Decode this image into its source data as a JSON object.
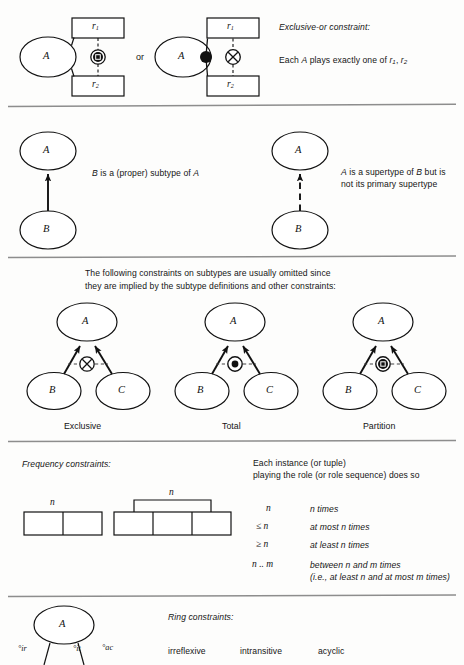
{
  "page": {
    "background": "#fdfdfc",
    "ink": "#1a1a1a",
    "rule_color": "#8a8a8a"
  },
  "section_xor": {
    "diagram_left": {
      "entity_label": "A",
      "role_box_1": "r",
      "role_box_1_sub": "1",
      "role_box_2": "r",
      "role_box_2_sub": "2",
      "constraint_symbol": "circled-dot-square"
    },
    "connector_word": "or",
    "diagram_right": {
      "entity_label": "A",
      "role_box_1": "r",
      "role_box_1_sub": "1",
      "role_box_2": "r",
      "role_box_2_sub": "2",
      "dot_symbol": "filled-dot",
      "constraint_symbol": "circled-x"
    },
    "heading": "Exclusive-or constraint:",
    "description_prefix": "Each ",
    "description_var": "A",
    "description_mid": " plays exactly one of ",
    "description_r1": "r",
    "description_r1_sub": "1",
    "description_comma": ", ",
    "description_r2": "r",
    "description_r2_sub": "2"
  },
  "section_subtype": {
    "left": {
      "super_label": "A",
      "sub_label": "B",
      "arrow_style": "solid",
      "text_prefix": "B",
      "text_body": " is a (proper) subtype of ",
      "text_suffix": "A"
    },
    "right": {
      "super_label": "A",
      "sub_label": "B",
      "arrow_style": "dashed",
      "text_line1_a": "A",
      "text_line1_b": " is a supertype of ",
      "text_line1_c": "B",
      "text_line1_d": " but is",
      "text_line2": "not its primary supertype"
    }
  },
  "section_implied": {
    "note_line1": "The following constraints on subtypes are usually omitted since",
    "note_line2": "they are implied by the subtype definitions and other constraints:",
    "diagrams": [
      {
        "super_label": "A",
        "sub_left_label": "B",
        "sub_right_label": "C",
        "symbol": "circled-x",
        "caption": "Exclusive"
      },
      {
        "super_label": "A",
        "sub_left_label": "B",
        "sub_right_label": "C",
        "symbol": "circled-dot",
        "caption": "Total"
      },
      {
        "super_label": "A",
        "sub_left_label": "B",
        "sub_right_label": "C",
        "symbol": "circled-dot-square",
        "caption": "Partition"
      }
    ]
  },
  "section_frequency": {
    "heading": "Frequency constraints:",
    "diagram_left_label": "n",
    "diagram_right_label": "n",
    "right_note_line1": "Each instance (or tuple)",
    "right_note_line2": "playing the role (or role sequence) does so",
    "rows": [
      {
        "symbol": "n",
        "meaning_pre": "",
        "meaning": "n times"
      },
      {
        "symbol": "≤ n",
        "meaning": "at most n times"
      },
      {
        "symbol": "≥ n",
        "meaning": "at least n times"
      },
      {
        "symbol": "n .. m",
        "meaning": "between n and m times",
        "meaning_line2": "(i.e., at least n and at most m times)"
      }
    ]
  },
  "section_ring": {
    "entity_label": "A",
    "heading": "Ring constraints:",
    "markers": [
      {
        "degree": "°",
        "name": "ir"
      },
      {
        "degree": "°",
        "name": "it"
      },
      {
        "degree": "°",
        "name": "ac"
      }
    ],
    "terms": [
      "irreflexive",
      "intransitive",
      "acyclic"
    ]
  }
}
